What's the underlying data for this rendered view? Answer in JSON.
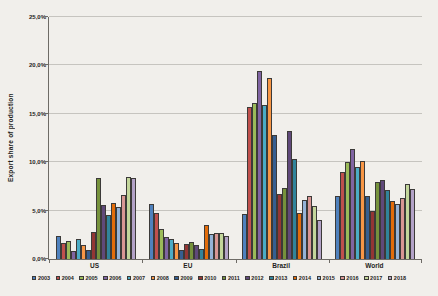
{
  "page": {
    "background": "#f1efeb"
  },
  "chart_data": {
    "type": "bar",
    "title": "",
    "xlabel": "",
    "ylabel": "Export share of production",
    "categories": [
      "US",
      "EU",
      "Brazil",
      "World"
    ],
    "series": [
      {
        "name": "2003",
        "color": "#4F81BD",
        "values": [
          2.4,
          5.7,
          4.6,
          6.5
        ]
      },
      {
        "name": "2004",
        "color": "#C0504D",
        "values": [
          1.7,
          4.8,
          15.7,
          9.0
        ]
      },
      {
        "name": "2005",
        "color": "#9BBB59",
        "values": [
          1.9,
          3.1,
          16.1,
          10.0
        ]
      },
      {
        "name": "2006",
        "color": "#8064A2",
        "values": [
          0.8,
          2.3,
          19.4,
          11.4
        ]
      },
      {
        "name": "2007",
        "color": "#4BACC6",
        "values": [
          2.1,
          2.1,
          15.9,
          9.5
        ]
      },
      {
        "name": "2008",
        "color": "#F79646",
        "values": [
          1.4,
          1.7,
          18.7,
          10.1
        ]
      },
      {
        "name": "2009",
        "color": "#365F91",
        "values": [
          0.9,
          0.9,
          12.8,
          6.5
        ]
      },
      {
        "name": "2010",
        "color": "#943634",
        "values": [
          2.8,
          1.6,
          6.7,
          5.0
        ]
      },
      {
        "name": "2011",
        "color": "#76923C",
        "values": [
          8.4,
          1.8,
          7.3,
          8.0
        ]
      },
      {
        "name": "2012",
        "color": "#60497A",
        "values": [
          5.6,
          1.4,
          13.2,
          8.2
        ]
      },
      {
        "name": "2013",
        "color": "#31849B",
        "values": [
          4.5,
          1.0,
          10.3,
          7.1
        ]
      },
      {
        "name": "2014",
        "color": "#E36C0A",
        "values": [
          5.8,
          3.5,
          4.8,
          6.0
        ]
      },
      {
        "name": "2015",
        "color": "#95B3D7",
        "values": [
          5.4,
          2.6,
          6.1,
          5.7
        ]
      },
      {
        "name": "2016",
        "color": "#D99694",
        "values": [
          6.6,
          2.7,
          6.5,
          6.3
        ]
      },
      {
        "name": "2017",
        "color": "#C3D69B",
        "values": [
          8.5,
          2.7,
          5.5,
          7.7
        ]
      },
      {
        "name": "2018",
        "color": "#B3A2C7",
        "values": [
          8.4,
          2.4,
          4.0,
          7.2
        ]
      }
    ],
    "ylim": [
      0,
      25
    ],
    "ytick_step": 5,
    "ytick_labels": [
      "0,0%",
      "5,0%",
      "10,0%",
      "15,0%",
      "20,0%",
      "25,0%"
    ],
    "grid": true,
    "legend_position": "bottom",
    "bar_outline": "#3c3a38"
  }
}
